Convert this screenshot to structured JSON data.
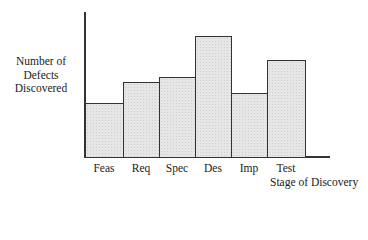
{
  "chart_data": {
    "type": "bar",
    "title": "",
    "xlabel": "Stage of Discovery",
    "ylabel": "Number of Defects Discovered",
    "ylabel_lines": [
      "Number of",
      "Defects",
      "Discovered"
    ],
    "categories": [
      "Feas",
      "Req",
      "Spec",
      "Des",
      "Imp",
      "Test"
    ],
    "values": [
      54,
      75,
      80,
      121,
      64,
      97
    ],
    "value_note": "relative heights (no y-axis scale shown)",
    "ylim": [
      0,
      146
    ],
    "grid": false,
    "legend": null
  }
}
